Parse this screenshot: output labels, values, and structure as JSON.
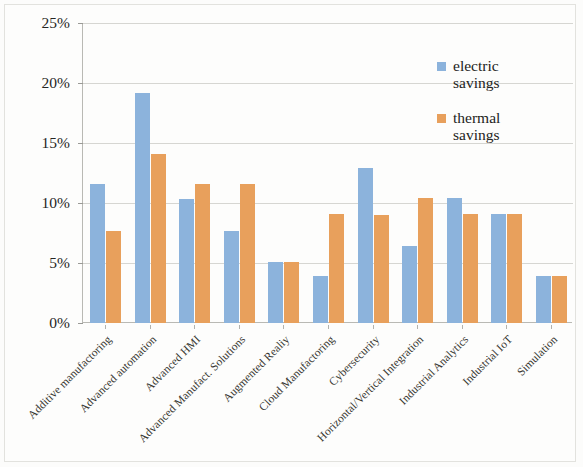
{
  "chart_data": {
    "type": "bar",
    "title": "",
    "subtitle": "",
    "xlabel": "",
    "ylabel": "",
    "ylim": [
      0,
      25
    ],
    "ytick_values": [
      0,
      5,
      10,
      15,
      20,
      25
    ],
    "ytick_labels": [
      "0%",
      "5%",
      "10%",
      "15%",
      "20%",
      "25%"
    ],
    "grid": true,
    "legend_position": "top-right",
    "value_suffix": "%",
    "categories": [
      "Additive manufactoring",
      "Advanced automation",
      "Advanced HMI",
      "Advanced Manufact. Solutions",
      "Augmented Realiy",
      "Cloud Manufactoring",
      "Cybersecurity",
      "Horizontal/Vertical Integration",
      "Industrial Analytics",
      "Industrial IoT",
      "Simulation"
    ],
    "series": [
      {
        "name": "electric savings",
        "color": "#8CB3DC",
        "values": [
          11.6,
          19.2,
          10.3,
          7.7,
          5.1,
          3.9,
          12.9,
          6.4,
          10.4,
          9.1,
          3.9
        ]
      },
      {
        "name": "thermal savings",
        "color": "#E8A05C",
        "values": [
          7.7,
          14.1,
          11.6,
          11.6,
          5.1,
          9.1,
          9.0,
          10.4,
          9.1,
          9.1,
          3.9
        ]
      }
    ]
  },
  "legend": {
    "items": [
      {
        "label": "electric\nsavings",
        "color": "#8CB3DC"
      },
      {
        "label": "thermal\nsavings",
        "color": "#E8A05C"
      }
    ]
  }
}
